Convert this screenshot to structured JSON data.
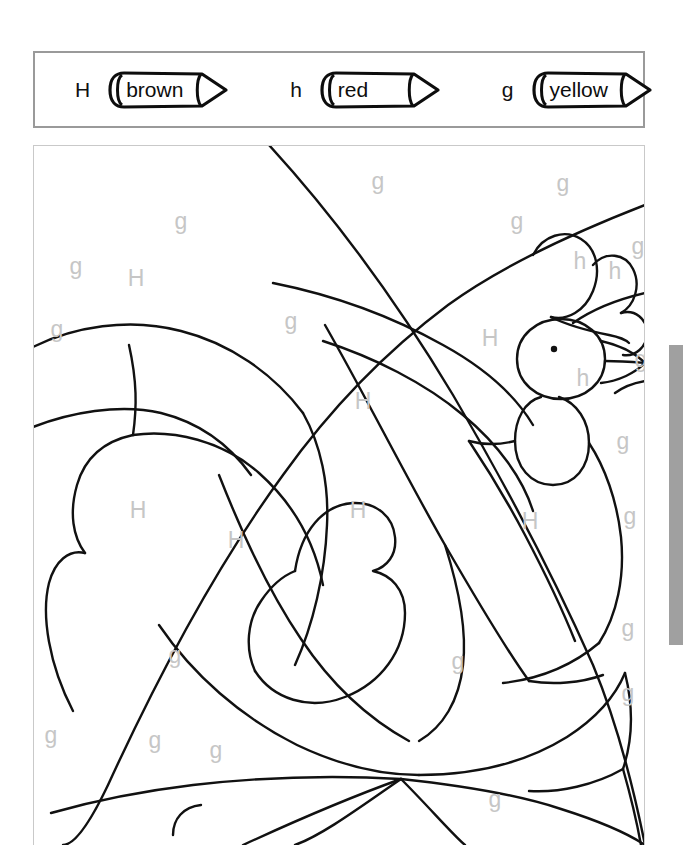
{
  "worksheet": {
    "type": "color-by-letter",
    "subject": "rooster",
    "legend": {
      "entries": [
        {
          "letter": "H",
          "color_name": "brown",
          "icon": "crayon-icon",
          "swatch": "#7b4a1e"
        },
        {
          "letter": "h",
          "color_name": "red",
          "icon": "crayon-icon",
          "swatch": "#d32f2f"
        },
        {
          "letter": "g",
          "color_name": "yellow",
          "icon": "crayon-icon",
          "swatch": "#f2c517"
        }
      ]
    },
    "picture": {
      "letter_color": "#c6c6c6",
      "line_color": "#111111",
      "region_labels": [
        {
          "letter": "g",
          "x": 345,
          "y": 38
        },
        {
          "letter": "g",
          "x": 530,
          "y": 40
        },
        {
          "letter": "g",
          "x": 148,
          "y": 78
        },
        {
          "letter": "g",
          "x": 484,
          "y": 78
        },
        {
          "letter": "g",
          "x": 605,
          "y": 103
        },
        {
          "letter": "h",
          "x": 547,
          "y": 118
        },
        {
          "letter": "h",
          "x": 582,
          "y": 128
        },
        {
          "letter": "g",
          "x": 43,
          "y": 123
        },
        {
          "letter": "H",
          "x": 103,
          "y": 135
        },
        {
          "letter": "g",
          "x": 24,
          "y": 186
        },
        {
          "letter": "g",
          "x": 258,
          "y": 178
        },
        {
          "letter": "H",
          "x": 457,
          "y": 195
        },
        {
          "letter": "g",
          "x": 608,
          "y": 216
        },
        {
          "letter": "h",
          "x": 550,
          "y": 235
        },
        {
          "letter": "H",
          "x": 330,
          "y": 258
        },
        {
          "letter": "g",
          "x": 590,
          "y": 298
        },
        {
          "letter": "H",
          "x": 105,
          "y": 367
        },
        {
          "letter": "H",
          "x": 325,
          "y": 367
        },
        {
          "letter": "H",
          "x": 497,
          "y": 378
        },
        {
          "letter": "H",
          "x": 203,
          "y": 397
        },
        {
          "letter": "g",
          "x": 597,
          "y": 373
        },
        {
          "letter": "g",
          "x": 142,
          "y": 512
        },
        {
          "letter": "g",
          "x": 425,
          "y": 518
        },
        {
          "letter": "g",
          "x": 595,
          "y": 485
        },
        {
          "letter": "g",
          "x": 595,
          "y": 550
        },
        {
          "letter": "g",
          "x": 18,
          "y": 592
        },
        {
          "letter": "g",
          "x": 122,
          "y": 597
        },
        {
          "letter": "g",
          "x": 183,
          "y": 607
        },
        {
          "letter": "g",
          "x": 462,
          "y": 656
        }
      ]
    },
    "scrollbar": {
      "orientation": "vertical",
      "thumb_color": "#a0a0a0"
    }
  }
}
